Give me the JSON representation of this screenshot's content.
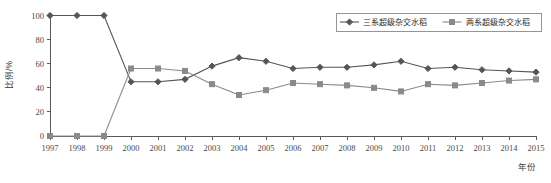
{
  "chart_data": {
    "type": "line",
    "title": "",
    "xlabel": "年份",
    "ylabel": "比例/%",
    "x": [
      1997,
      1998,
      1999,
      2000,
      2001,
      2002,
      2003,
      2004,
      2005,
      2006,
      2007,
      2008,
      2009,
      2010,
      2011,
      2012,
      2013,
      2014,
      2015
    ],
    "categories": [
      "1997",
      "1998",
      "1999",
      "2000",
      "2001",
      "2002",
      "2003",
      "2004",
      "2005",
      "2006",
      "2007",
      "2008",
      "2009",
      "2010",
      "2011",
      "2012",
      "2013",
      "2014",
      "2015"
    ],
    "series": [
      {
        "name": "三系超级杂交水稻",
        "marker": "diamond",
        "color": "#555555",
        "values": [
          100,
          100,
          100,
          45,
          45,
          47,
          58,
          65,
          62,
          56,
          57,
          57,
          59,
          62,
          56,
          57,
          55,
          54,
          53
        ]
      },
      {
        "name": "两系超级杂交水稻",
        "marker": "square",
        "color": "#8a8a8a",
        "values": [
          0,
          0,
          0,
          56,
          56,
          54,
          43,
          34,
          38,
          44,
          43,
          42,
          40,
          37,
          43,
          42,
          44,
          46,
          47
        ]
      }
    ],
    "ylim": [
      0,
      100
    ],
    "yticks": [
      0,
      20,
      40,
      60,
      80,
      100
    ],
    "ytick_labels": [
      "0",
      "20",
      "40",
      "60",
      "80",
      "100"
    ],
    "xlim": [
      1997,
      2015
    ],
    "grid": false,
    "legend_position": "top-right"
  },
  "axes": {
    "y_axis_label": "比例/%",
    "x_axis_label": "年份"
  },
  "legend": {
    "entries": [
      {
        "label": "三系超级杂交水稻",
        "marker": "diamond-marker"
      },
      {
        "label": "两系超级杂交水稻",
        "marker": "square-marker"
      }
    ]
  },
  "colors": {
    "series_one": "#555555",
    "series_two": "#8a8a8a",
    "axis": "#5a5a5a",
    "text": "#3a3a3a",
    "background": "#ffffff"
  }
}
